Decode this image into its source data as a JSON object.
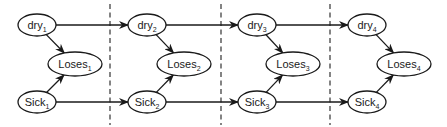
{
  "diagram": {
    "type": "dynamic-bayesian-network",
    "colors": {
      "stroke": "#1a1a1a",
      "fill": "#ffffff",
      "divider": "#333333"
    },
    "time_slices": [
      {
        "index": 1,
        "dry": {
          "base": "dry",
          "sub": "1",
          "cx": 37,
          "cy": 25
        },
        "loses": {
          "base": "Loses",
          "sub": "1",
          "cx": 75,
          "cy": 64
        },
        "sick": {
          "base": "Sick",
          "sub": "1",
          "cx": 37,
          "cy": 102
        }
      },
      {
        "index": 2,
        "dry": {
          "base": "dry",
          "sub": "2",
          "cx": 147,
          "cy": 25
        },
        "loses": {
          "base": "Loses",
          "sub": "2",
          "cx": 184,
          "cy": 64
        },
        "sick": {
          "base": "Sick",
          "sub": "2",
          "cx": 147,
          "cy": 102
        }
      },
      {
        "index": 3,
        "dry": {
          "base": "dry",
          "sub": "3",
          "cx": 257,
          "cy": 25
        },
        "loses": {
          "base": "Loses",
          "sub": "3",
          "cx": 293,
          "cy": 64
        },
        "sick": {
          "base": "Sick",
          "sub": "3",
          "cx": 257,
          "cy": 102
        }
      },
      {
        "index": 4,
        "dry": {
          "base": "dry",
          "sub": "4",
          "cx": 367,
          "cy": 25
        },
        "loses": {
          "base": "Loses",
          "sub": "4",
          "cx": 404,
          "cy": 64
        },
        "sick": {
          "base": "Sick",
          "sub": "4",
          "cx": 367,
          "cy": 102
        }
      }
    ],
    "dividers_x": [
      110,
      221,
      330
    ],
    "edges": [
      {
        "from": "dry1",
        "to": "Loses1"
      },
      {
        "from": "Sick1",
        "to": "Loses1"
      },
      {
        "from": "dry1",
        "to": "dry2"
      },
      {
        "from": "Sick1",
        "to": "Sick2"
      },
      {
        "from": "dry2",
        "to": "Loses2"
      },
      {
        "from": "Sick2",
        "to": "Loses2"
      },
      {
        "from": "dry2",
        "to": "dry3"
      },
      {
        "from": "Sick2",
        "to": "Sick3"
      },
      {
        "from": "dry3",
        "to": "Loses3"
      },
      {
        "from": "Sick3",
        "to": "Loses3"
      },
      {
        "from": "dry3",
        "to": "dry4"
      },
      {
        "from": "Sick3",
        "to": "Sick4"
      },
      {
        "from": "dry4",
        "to": "Loses4"
      },
      {
        "from": "Sick4",
        "to": "Loses4"
      }
    ]
  }
}
